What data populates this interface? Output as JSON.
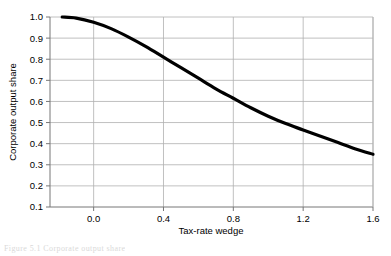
{
  "chart_data": {
    "type": "line",
    "title": "",
    "xlabel": "Tax-rate wedge",
    "ylabel": "Corporate output share",
    "xlim": [
      -0.25,
      1.6
    ],
    "ylim": [
      0.1,
      1.0
    ],
    "xticks": [
      "0.0",
      "0.4",
      "0.8",
      "1.2",
      "1.6"
    ],
    "xtick_values": [
      0.0,
      0.4,
      0.8,
      1.2,
      1.6
    ],
    "yticks": [
      "0.1",
      "0.2",
      "0.3",
      "0.4",
      "0.5",
      "0.6",
      "0.7",
      "0.8",
      "0.9",
      "1.0"
    ],
    "ytick_values": [
      0.1,
      0.2,
      0.3,
      0.4,
      0.5,
      0.6,
      0.7,
      0.8,
      0.9,
      1.0
    ],
    "grid": true,
    "legend": "none",
    "line_color": "#000000",
    "grid_color": "#b0b0b0",
    "axis_color": "#808080",
    "series": [
      {
        "name": "Corporate output share",
        "x": [
          -0.18,
          -0.1,
          0.0,
          0.1,
          0.2,
          0.3,
          0.4,
          0.5,
          0.6,
          0.7,
          0.8,
          0.9,
          1.0,
          1.1,
          1.2,
          1.3,
          1.4,
          1.5,
          1.6
        ],
        "values": [
          1.0,
          0.995,
          0.975,
          0.945,
          0.905,
          0.86,
          0.81,
          0.76,
          0.71,
          0.66,
          0.615,
          0.57,
          0.53,
          0.495,
          0.465,
          0.435,
          0.405,
          0.375,
          0.35
        ]
      }
    ]
  },
  "caption": {
    "text": "Figure  5.1  Corporate  output  share"
  }
}
